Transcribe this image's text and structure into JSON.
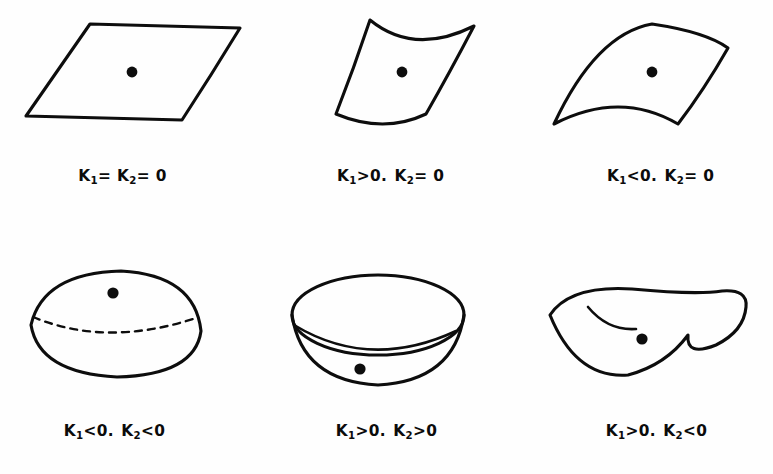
{
  "figure": {
    "background_color": "#ffffff",
    "ink_color": "#0d0d0d",
    "panels": [
      {
        "id": "plane",
        "shape_name": "plane",
        "shape_description": "flat parallelogram patch with marked center point",
        "k1": "K1 = 0",
        "k2": "K2 = 0",
        "label_k1_sym": "K",
        "label_k1_sub": "1",
        "label_rel1": "=",
        "label_k2_sym": "K",
        "label_k2_sub": "2",
        "label_rel2": "=",
        "label_value": "0",
        "separator": "",
        "caption_plain": "K1= K2= 0",
        "has_dot": true,
        "dot_label": "center-point"
      },
      {
        "id": "parabolic-up",
        "shape_name": "cylindrical-concave",
        "shape_description": "cylinder patch curving upward, zero curvature along one direction",
        "k1": "K1 > 0",
        "k2": "K2 = 0",
        "label_k1_sym": "K",
        "label_k1_sub": "1",
        "label_rel1": ">0",
        "label_k2_sym": "K",
        "label_k2_sub": "2",
        "label_rel2": "= 0",
        "separator": ".",
        "caption_plain": "K1>0 . K2 = 0",
        "has_dot": true,
        "dot_label": "center-point"
      },
      {
        "id": "parabolic-down",
        "shape_name": "cylindrical-convex",
        "shape_description": "cylinder patch curving downward, zero curvature along one direction",
        "k1": "K1 < 0",
        "k2": "K2 = 0",
        "label_k1_sym": "K",
        "label_k1_sub": "1",
        "label_rel1": "<0",
        "label_k2_sym": "K",
        "label_k2_sub": "2",
        "label_rel2": "= 0",
        "separator": ".",
        "caption_plain": "K1<0 . K2 = 0",
        "has_dot": true,
        "dot_label": "center-point"
      },
      {
        "id": "dome",
        "shape_name": "elliptic-dome",
        "shape_description": "convex dome with hidden equator drawn dashed, point on upper surface",
        "k1": "K1 < 0",
        "k2": "K2 < 0",
        "label_k1_sym": "K",
        "label_k1_sub": "1",
        "label_rel1": "<0",
        "label_k2_sym": "K",
        "label_k2_sub": "2",
        "label_rel2": "<0",
        "separator": ".",
        "caption_plain": "K1<0 . K2<0",
        "has_dot": true,
        "dot_label": "surface-point"
      },
      {
        "id": "bowl",
        "shape_name": "elliptic-bowl",
        "shape_description": "concave bowl, rim ellipse with interior floor curve, point at bottom",
        "k1": "K1 > 0",
        "k2": "K2 > 0",
        "label_k1_sym": "K",
        "label_k1_sub": "1",
        "label_rel1": ">0",
        "label_k2_sym": "K",
        "label_k2_sub": "2",
        "label_rel2": ">0",
        "separator": ".",
        "caption_plain": "K1>0 . K2>0",
        "has_dot": true,
        "dot_label": "bottom-point"
      },
      {
        "id": "saddle",
        "shape_name": "hyperbolic-saddle",
        "shape_description": "saddle surface curving up in one direction and down in the other",
        "k1": "K1 > 0",
        "k2": "K2 < 0",
        "label_k1_sym": "K",
        "label_k1_sub": "1",
        "label_rel1": ">0",
        "label_k2_sym": "K",
        "label_k2_sub": "2",
        "label_rel2": "<0",
        "separator": ".",
        "caption_plain": "K1>0 . K2<0",
        "has_dot": true,
        "dot_label": "saddle-point"
      }
    ]
  }
}
